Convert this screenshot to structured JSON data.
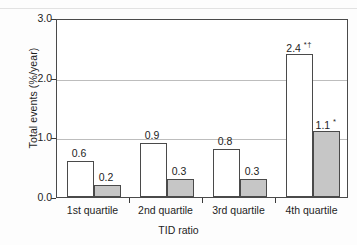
{
  "chart_data": {
    "type": "bar",
    "title": "",
    "xlabel": "TID ratio",
    "ylabel": "Total events (%/year)",
    "categories": [
      "1st quartile",
      "2nd quartile",
      "3rd quartile",
      "4th quartile"
    ],
    "series": [
      {
        "name": "open",
        "values": [
          0.6,
          0.9,
          0.8,
          2.4
        ],
        "labels": [
          "0.6",
          "0.9",
          "0.8",
          "2.4"
        ],
        "annotations": [
          "",
          "",
          "",
          "*†"
        ],
        "fill": "#ffffff"
      },
      {
        "name": "solid",
        "values": [
          0.2,
          0.3,
          0.3,
          1.1
        ],
        "labels": [
          "0.2",
          "0.3",
          "0.3",
          "1.1"
        ],
        "annotations": [
          "",
          "",
          "",
          "*"
        ],
        "fill": "#c6c6c6"
      }
    ],
    "ylim": [
      0.0,
      3.0
    ],
    "yticks": [
      "0.0",
      "1.0",
      "2.0",
      "3.0"
    ],
    "ytick_values": [
      0.0,
      1.0,
      2.0,
      3.0
    ],
    "grid": "horizontal",
    "gridline_values": [
      1.0,
      2.0
    ],
    "legend": "none",
    "axis_color": "#4a4a4a",
    "grid_color": "#bdbdbd",
    "text_color": "#1d1d1d"
  }
}
